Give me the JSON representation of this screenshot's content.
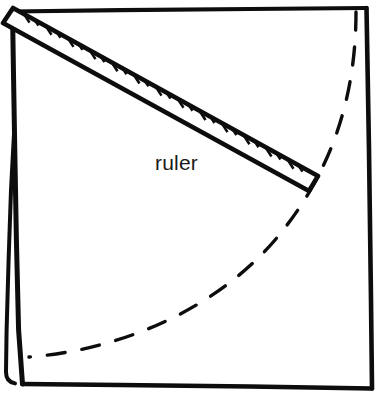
{
  "figure": {
    "style": "hand-drawn line illustration",
    "background_color": "#ffffff",
    "ink_color": "#0d0d0d",
    "canvas": {
      "width": 385,
      "height": 405
    }
  },
  "labels": {
    "ruler_label": "ruler"
  },
  "page_frame": {
    "name": "page-sheet",
    "description": "square sheet of paper with a folded spine along the left edge",
    "border_color": "#0d0d0d",
    "corners": {
      "top_left": [
        12,
        11
      ],
      "top_right": [
        366,
        8
      ],
      "bottom_right": [
        372,
        388
      ],
      "bottom_left": [
        22,
        384
      ]
    },
    "spine": {
      "name": "left-spine-fold",
      "description": "thick left edge splitting into a second line below mid-height",
      "split_y": 140,
      "rejoin_y": 382
    }
  },
  "ruler": {
    "name": "ruler-object",
    "description": "straight edge laid diagonally from the top-left corner toward the dashed arc",
    "start_point": [
      8,
      16
    ],
    "end_point": [
      311,
      183
    ],
    "thickness_px": 15,
    "tick_marks": {
      "count": 28,
      "edge": "upper",
      "pattern": "alternating long and short graduations",
      "long_tick_length": 11,
      "short_tick_length": 7
    },
    "fill_color": "#ffffff",
    "outline_color": "#0d0d0d"
  },
  "arc": {
    "name": "dashed-arc",
    "description": "dashed quarter circle sweeping from the top edge down to the bottom-left",
    "style": "dashed",
    "dash_length": 18,
    "dash_gap": 17,
    "stroke_width": 3.4,
    "start_point": [
      356,
      12
    ],
    "end_point": [
      29,
      357
    ],
    "passes_through": [
      [
        311,
        183
      ],
      [
        200,
        306
      ]
    ],
    "center_estimate": [
      12,
      11
    ],
    "radius_estimate": 350
  },
  "colors": {
    "ink": "#0d0d0d",
    "paper": "#ffffff",
    "text": "#1a1a1a"
  }
}
